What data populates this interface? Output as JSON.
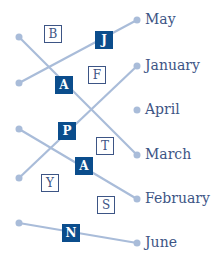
{
  "diagram": {
    "colors": {
      "line": "#a9bcd9",
      "dot": "#a9bcd9",
      "filled_tile": "#0b4d8c",
      "outline_tile": "#3d5585",
      "label": "#3d5585"
    },
    "left_dots": [
      {
        "x": 19,
        "y": 37
      },
      {
        "x": 19,
        "y": 83
      },
      {
        "x": 19,
        "y": 129
      },
      {
        "x": 19,
        "y": 178
      },
      {
        "x": 19,
        "y": 223
      }
    ],
    "months": [
      {
        "label": "May",
        "x": 137,
        "y": 20
      },
      {
        "label": "January",
        "x": 137,
        "y": 66
      },
      {
        "label": "April",
        "x": 137,
        "y": 110
      },
      {
        "label": "March",
        "x": 137,
        "y": 155
      },
      {
        "label": "February",
        "x": 137,
        "y": 199
      },
      {
        "label": "June",
        "x": 137,
        "y": 243
      }
    ],
    "connections": [
      {
        "from": 0,
        "to": "March"
      },
      {
        "from": 1,
        "to": "May"
      },
      {
        "from": 2,
        "to": "February"
      },
      {
        "from": 3,
        "to": "January"
      },
      {
        "from": 4,
        "to": "June"
      }
    ],
    "filled_tiles": [
      {
        "letter": "J",
        "x": 104,
        "y": 40
      },
      {
        "letter": "A",
        "x": 64,
        "y": 85
      },
      {
        "letter": "P",
        "x": 67,
        "y": 131
      },
      {
        "letter": "A",
        "x": 84,
        "y": 166
      },
      {
        "letter": "N",
        "x": 71,
        "y": 233
      }
    ],
    "outline_tiles": [
      {
        "letter": "B",
        "x": 53,
        "y": 34
      },
      {
        "letter": "F",
        "x": 97,
        "y": 75
      },
      {
        "letter": "T",
        "x": 105,
        "y": 146
      },
      {
        "letter": "Y",
        "x": 50,
        "y": 183
      },
      {
        "letter": "S",
        "x": 106,
        "y": 205
      }
    ]
  }
}
